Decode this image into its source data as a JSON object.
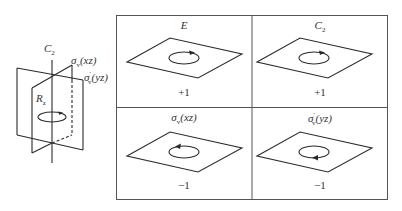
{
  "figure": {
    "axis_diagram": {
      "axis_label": "C",
      "axis_label_sub": "2",
      "rotation_label": "R",
      "rotation_label_sub": "z",
      "plane1_label_sym": "σ",
      "plane1_label_sub": "v",
      "plane1_label_arg": "(xz)",
      "plane2_label_sym": "σ",
      "plane2_label_sub": "v",
      "plane2_label_sup": "′",
      "plane2_label_arg": "(yz)"
    },
    "table": {
      "cells": [
        {
          "op": "E",
          "op_sub": "",
          "op_sup": "",
          "op_arg": "",
          "character": "+1",
          "rotation": "counterclockwise"
        },
        {
          "op": "C",
          "op_sub": "2",
          "op_sup": "",
          "op_arg": "",
          "character": "+1",
          "rotation": "counterclockwise"
        },
        {
          "op": "σ",
          "op_sub": "v",
          "op_sup": "",
          "op_arg": "(xz)",
          "character": "−1",
          "rotation": "clockwise"
        },
        {
          "op": "σ",
          "op_sub": "v",
          "op_sup": "′",
          "op_arg": "(yz)",
          "character": "−1",
          "rotation": "clockwise"
        }
      ]
    },
    "colors": {
      "line": "#2a2a2a",
      "border": "#555555",
      "background": "#ffffff"
    }
  }
}
